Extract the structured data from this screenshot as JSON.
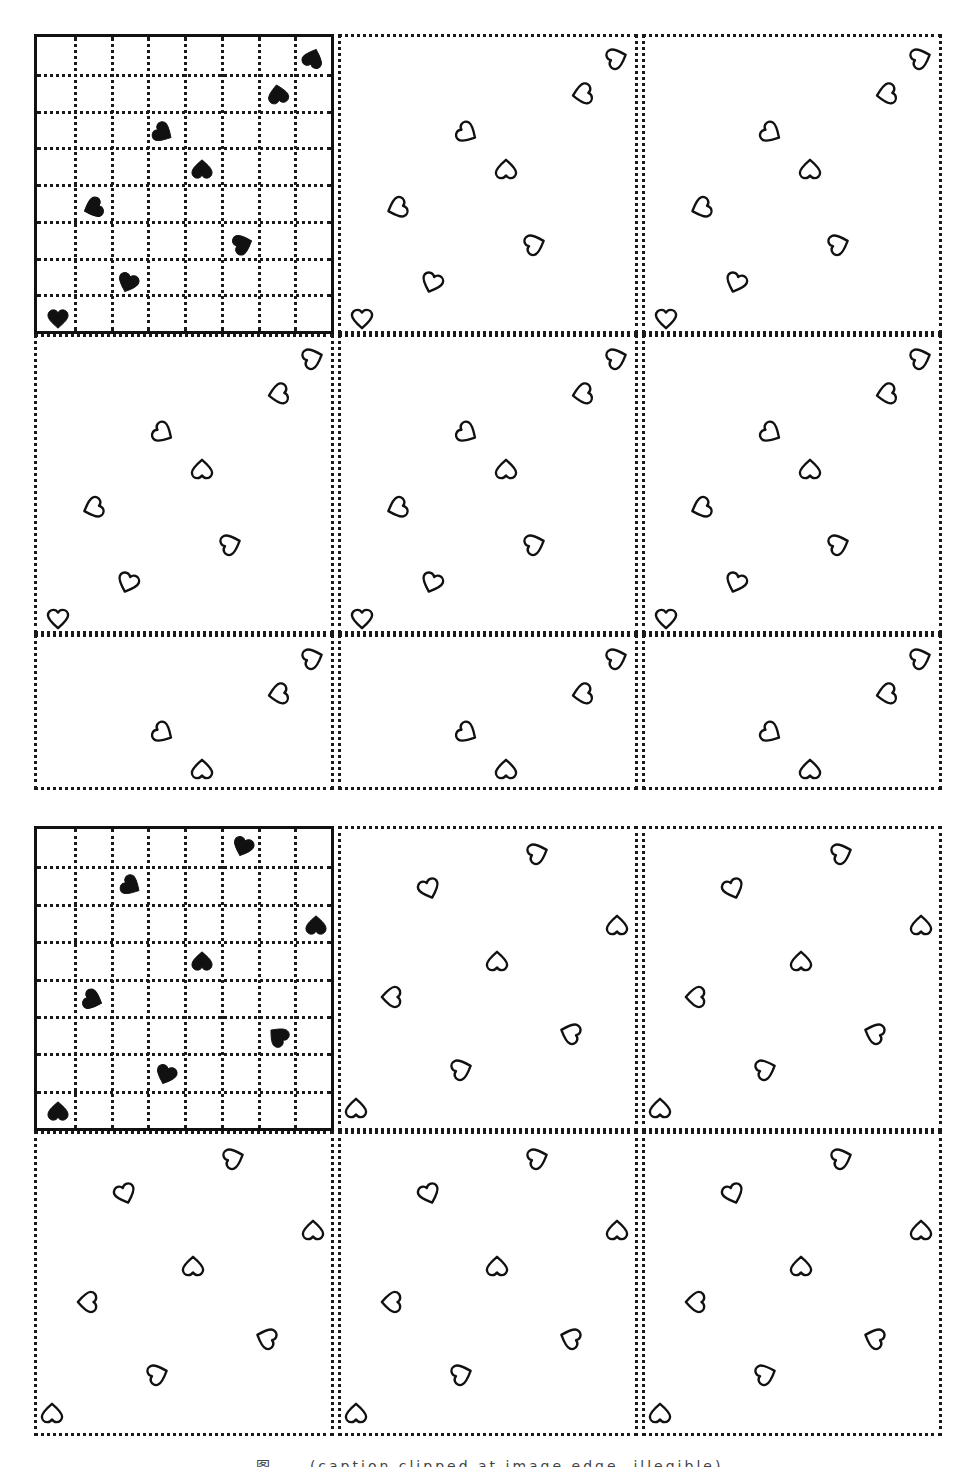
{
  "figure": {
    "caption": "图 ... (caption clipped at image edge, illegible)",
    "colors": {
      "ink": "#111111",
      "paper": "#ffffff"
    }
  },
  "blocks": [
    {
      "name": "pattern-block-a",
      "top": 34,
      "rows": [
        300,
        300,
        156
      ],
      "motif_grid_size": 8,
      "motif_hearts": [
        {
          "x": 0.94,
          "y": 0.07,
          "rot": 200
        },
        {
          "x": 0.82,
          "y": 0.19,
          "rot": 170
        },
        {
          "x": 0.43,
          "y": 0.32,
          "rot": 300
        },
        {
          "x": 0.56,
          "y": 0.44,
          "rot": 180
        },
        {
          "x": 0.19,
          "y": 0.57,
          "rot": 70
        },
        {
          "x": 0.7,
          "y": 0.69,
          "rot": 250
        },
        {
          "x": 0.31,
          "y": 0.82,
          "rot": 20
        },
        {
          "x": 0.07,
          "y": 0.94,
          "rot": 0
        }
      ],
      "repeat_hearts": [
        {
          "x": 0.94,
          "y": 0.07,
          "rot": 250
        },
        {
          "x": 0.82,
          "y": 0.19,
          "rot": 80
        },
        {
          "x": 0.43,
          "y": 0.32,
          "rot": 300
        },
        {
          "x": 0.56,
          "y": 0.44,
          "rot": 180
        },
        {
          "x": 0.19,
          "y": 0.57,
          "rot": 70
        },
        {
          "x": 0.66,
          "y": 0.69,
          "rot": 250
        },
        {
          "x": 0.31,
          "y": 0.82,
          "rot": 20
        },
        {
          "x": 0.07,
          "y": 0.94,
          "rot": 0
        }
      ]
    },
    {
      "name": "pattern-block-b",
      "top": 826,
      "rows": [
        305,
        305,
        0
      ],
      "motif_grid_size": 8,
      "motif_hearts": [
        {
          "x": 0.7,
          "y": 0.06,
          "rot": 20
        },
        {
          "x": 0.32,
          "y": 0.19,
          "rot": 300
        },
        {
          "x": 0.95,
          "y": 0.32,
          "rot": 180
        },
        {
          "x": 0.56,
          "y": 0.44,
          "rot": 180
        },
        {
          "x": 0.19,
          "y": 0.57,
          "rot": 290
        },
        {
          "x": 0.82,
          "y": 0.69,
          "rot": 130
        },
        {
          "x": 0.44,
          "y": 0.82,
          "rot": 20
        },
        {
          "x": 0.07,
          "y": 0.94,
          "rot": 180
        }
      ],
      "repeat_hearts": [
        {
          "x": 0.67,
          "y": 0.08,
          "rot": 250
        },
        {
          "x": 0.3,
          "y": 0.2,
          "rot": 340
        },
        {
          "x": 0.94,
          "y": 0.32,
          "rot": 180
        },
        {
          "x": 0.53,
          "y": 0.44,
          "rot": 180
        },
        {
          "x": 0.17,
          "y": 0.56,
          "rot": 90
        },
        {
          "x": 0.78,
          "y": 0.68,
          "rot": 110
        },
        {
          "x": 0.41,
          "y": 0.8,
          "rot": 250
        },
        {
          "x": 0.05,
          "y": 0.93,
          "rot": 180
        }
      ]
    }
  ]
}
